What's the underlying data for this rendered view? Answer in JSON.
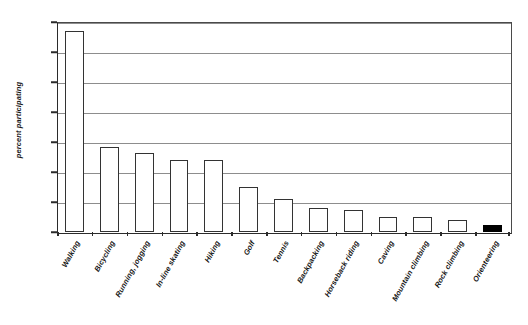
{
  "chart_data": {
    "type": "bar",
    "title": "",
    "subtitle": "",
    "xlabel": "",
    "ylabel": "percent participating",
    "ylim": [
      0,
      70
    ],
    "ytick_values": [
      0,
      10,
      20,
      30,
      40,
      50,
      60,
      70
    ],
    "ytick_labels": [
      "0%",
      "10%",
      "20%",
      "30%",
      "40%",
      "50%",
      "60%",
      "70%"
    ],
    "grid": true,
    "legend": null,
    "legend_position": "none",
    "categories": [
      "Walking",
      "Bicycling",
      "Running, jogging",
      "In-line skating",
      "Hiking",
      "Golf",
      "Tennis",
      "Backpacking",
      "Horseback riding",
      "Caving",
      "Mountain climbing",
      "Rock climbing",
      "Orienteering"
    ],
    "values": [
      67,
      28.5,
      26.5,
      24,
      24,
      15,
      11,
      8,
      7.5,
      5,
      5,
      4,
      2.5
    ],
    "value_labels": [
      "67%",
      "28.5%",
      "26.5%",
      "24%",
      "24%",
      "15%",
      "11%",
      "8%",
      "7.5%",
      "5%",
      "5%",
      "4%",
      "2.5%"
    ],
    "bar_styles": [
      "open",
      "open",
      "open",
      "open",
      "open",
      "open",
      "open",
      "open",
      "open",
      "open",
      "open",
      "open",
      "filled"
    ],
    "highlighted_category": "Orienteering",
    "colors": {
      "bar_fill": "#ffffff",
      "bar_outline": "#333333",
      "highlight_fill": "#000000",
      "gridline": "#8d8d8d",
      "axis": "#2b2b2b",
      "text": "#161616",
      "background": "#ffffff"
    }
  }
}
